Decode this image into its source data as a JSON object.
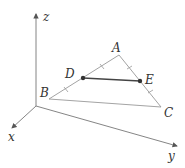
{
  "diagram": {
    "type": "3d-triangle-midsegment",
    "axes": {
      "x": {
        "label": "x"
      },
      "y": {
        "label": "y"
      },
      "z": {
        "label": "z"
      }
    },
    "vertices": {
      "A": {
        "label": "A"
      },
      "B": {
        "label": "B"
      },
      "C": {
        "label": "C"
      }
    },
    "points": {
      "D": {
        "label": "D",
        "on": "AB",
        "note": "midpoint"
      },
      "E": {
        "label": "E",
        "on": "AC",
        "note": "midpoint"
      }
    },
    "segments": [
      "AB",
      "BC",
      "CA",
      "DE"
    ],
    "colors": {
      "axis": "#777777",
      "edge": "#999999",
      "segment": "#444444",
      "point": "#333333"
    }
  }
}
